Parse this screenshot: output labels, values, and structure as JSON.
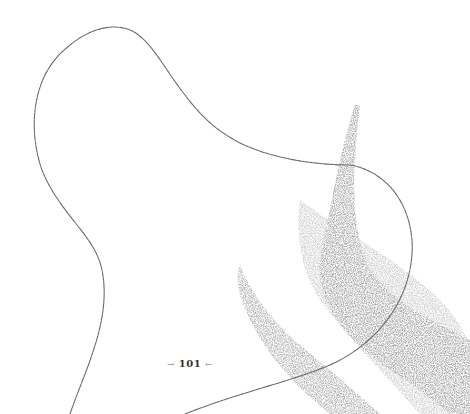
{
  "page": {
    "page_number": "101",
    "left_arrow": "→",
    "right_arrow": "←"
  },
  "colors": {
    "background": "#ffffff",
    "line": "#6a6a6a",
    "texture": "#5a5a5a",
    "text": "#333333"
  }
}
